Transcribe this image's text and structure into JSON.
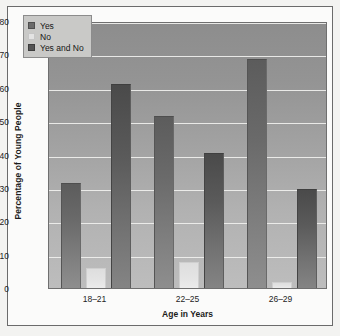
{
  "chart_data": {
    "type": "bar",
    "title": "",
    "xlabel": "Age in Years",
    "ylabel": "Percentage of Young People",
    "categories": [
      "18–21",
      "22–25",
      "26–29"
    ],
    "series": [
      {
        "name": "Yes",
        "values": [
          31.5,
          51.5,
          68.5
        ],
        "color": "#6b6b6b"
      },
      {
        "name": "No",
        "values": [
          6.0,
          7.8,
          1.8
        ],
        "color": "#e3e3e3"
      },
      {
        "name": "Yes and No",
        "values": [
          61.0,
          40.5,
          29.8
        ],
        "color": "#545454"
      }
    ],
    "ylim": [
      0,
      80
    ],
    "yticks": [
      0,
      10,
      20,
      30,
      40,
      50,
      60,
      70,
      80
    ],
    "ytick_labels": [
      "0",
      "10",
      "20",
      "30",
      "40",
      "50",
      "60",
      "70",
      "80"
    ],
    "grid": "horizontal",
    "legend_position": "top-left",
    "plot_background": "#a3a3a3",
    "page_background": "#fbfbfa"
  },
  "legend": {
    "items": [
      {
        "label": "Yes",
        "swatch": "yes"
      },
      {
        "label": "No",
        "swatch": "no"
      },
      {
        "label": "Yes and No",
        "swatch": "yesno"
      }
    ]
  },
  "axes": {
    "y_title": "Percentage of Young People",
    "x_title": "Age in Years",
    "y_ticks": [
      "80",
      "70",
      "60",
      "50",
      "40",
      "30",
      "20",
      "10",
      "0"
    ],
    "x_ticks": [
      "18–21",
      "22–25",
      "26–29"
    ]
  }
}
